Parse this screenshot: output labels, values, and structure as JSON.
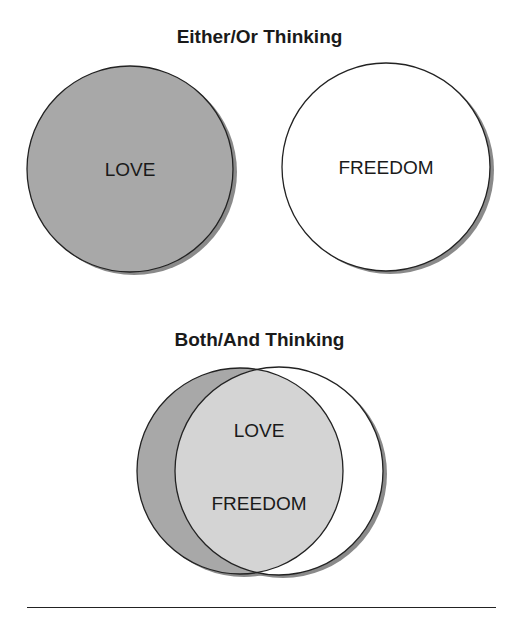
{
  "titles": {
    "top": "Either/Or Thinking",
    "bottom": "Both/And Thinking"
  },
  "either_or": {
    "left_label": "LOVE",
    "right_label": "FREEDOM"
  },
  "both_and": {
    "labels": [
      "LOVE",
      "FREEDOM"
    ]
  },
  "colors": {
    "love_fill": "#a8a8a8",
    "freedom_fill": "#ffffff",
    "overlap_fill": "#d4d4d4",
    "outline": "#222222",
    "shadow": "#8a8a8a"
  }
}
